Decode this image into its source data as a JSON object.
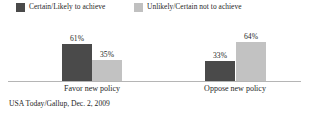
{
  "chart_data": {
    "type": "bar",
    "title": "",
    "xlabel": "",
    "ylabel": "",
    "ylim": [
      0,
      100
    ],
    "grid": false,
    "legend_position": "top",
    "categories": [
      "Favor new policy",
      "Oppose new policy"
    ],
    "series": [
      {
        "name": "Certain/Likely to achieve",
        "color": "#4a4a4a",
        "values": [
          61,
          35
        ],
        "value_labels": [
          "61%",
          "35%"
        ]
      },
      {
        "name": "Unlikely/Certain not to achieve",
        "color": "#c2c2c2",
        "values": [
          33,
          64
        ],
        "value_labels": [
          "33%",
          "64%"
        ]
      }
    ],
    "groups": [
      {
        "category": "Favor new policy",
        "bars": [
          {
            "series": "Certain/Likely to achieve",
            "value": 61,
            "label": "61%"
          },
          {
            "series": "Unlikely/Certain not to achieve",
            "value": 35,
            "label": "35%"
          }
        ]
      },
      {
        "category": "Oppose new policy",
        "bars": [
          {
            "series": "Certain/Likely to achieve",
            "value": 33,
            "label": "33%"
          },
          {
            "series": "Unlikely/Certain not to achieve",
            "value": 64,
            "label": "64%"
          }
        ]
      }
    ],
    "source": "USA Today/Gallup, Dec. 2, 2009"
  },
  "legend": {
    "items": [
      {
        "label": "Certain/Likely to achieve",
        "swatch": "dark-swatch",
        "color": "#4a4a4a"
      },
      {
        "label": "Unlikely/Certain not to achieve",
        "swatch": "light-swatch",
        "color": "#c2c2c2"
      }
    ]
  },
  "axis": {
    "categories": [
      {
        "label": "Favor new policy"
      },
      {
        "label": "Oppose new policy"
      }
    ]
  },
  "values": {
    "favor_certain": "61%",
    "favor_unlikely": "35%",
    "oppose_certain": "33%",
    "oppose_unlikely": "64%"
  },
  "footer": {
    "source": "USA Today/Gallup, Dec. 2, 2009"
  },
  "colors": {
    "dark": "#4a4a4a",
    "light": "#c2c2c2",
    "baseline": "#b5b5b5",
    "text": "#262626",
    "background": "#ffffff"
  }
}
